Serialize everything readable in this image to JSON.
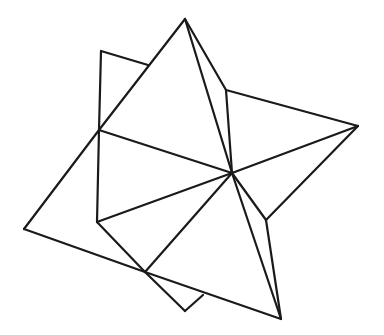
{
  "diagram": {
    "stroke_color": "#1a1a1a",
    "background": "#ffffff",
    "stroke_width": 2.2,
    "vertices": {
      "top": [
        185,
        19
      ],
      "sq_top_left": [
        101,
        51
      ],
      "sq_top_join": [
        148,
        65
      ],
      "notch_upper_right": [
        226,
        90
      ],
      "left": [
        99,
        130
      ],
      "right_tip": [
        358,
        126
      ],
      "center": [
        232,
        173
      ],
      "notch_lower_right": [
        266,
        220
      ],
      "lower_left": [
        97,
        222
      ],
      "left_tip": [
        24,
        229
      ],
      "lower_cross": [
        145,
        272
      ],
      "sq_bottom": [
        185,
        311
      ],
      "sq_bottom_join": [
        203,
        295
      ],
      "bottom_tip": [
        281,
        319
      ]
    },
    "edges": [
      [
        "sq_top_left",
        "sq_top_join"
      ],
      [
        "sq_top_left",
        "left"
      ],
      [
        "left",
        "lower_left"
      ],
      [
        "top",
        "left"
      ],
      [
        "left",
        "left_tip"
      ],
      [
        "left_tip",
        "lower_cross"
      ],
      [
        "top",
        "notch_upper_right"
      ],
      [
        "top",
        "center"
      ],
      [
        "notch_upper_right",
        "center"
      ],
      [
        "notch_upper_right",
        "right_tip"
      ],
      [
        "right_tip",
        "center"
      ],
      [
        "right_tip",
        "notch_lower_right"
      ],
      [
        "left",
        "center"
      ],
      [
        "lower_left",
        "center"
      ],
      [
        "center",
        "lower_cross"
      ],
      [
        "center",
        "notch_lower_right"
      ],
      [
        "center",
        "bottom_tip"
      ],
      [
        "notch_lower_right",
        "bottom_tip"
      ],
      [
        "lower_left",
        "lower_cross"
      ],
      [
        "lower_cross",
        "sq_bottom"
      ],
      [
        "sq_bottom",
        "sq_bottom_join"
      ],
      [
        "lower_cross",
        "bottom_tip"
      ]
    ]
  }
}
